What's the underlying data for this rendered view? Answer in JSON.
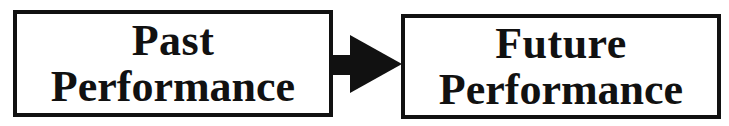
{
  "diagram": {
    "type": "flow",
    "nodes": [
      {
        "id": "past",
        "line1": "Past",
        "line2": "Performance"
      },
      {
        "id": "future",
        "line1": "Future",
        "line2": "Performance"
      }
    ],
    "edges": [
      {
        "from": "past",
        "to": "future",
        "style": "solid-block-arrow"
      }
    ],
    "colors": {
      "stroke": "#111111",
      "fill": "#ffffff",
      "arrow": "#111111"
    }
  }
}
